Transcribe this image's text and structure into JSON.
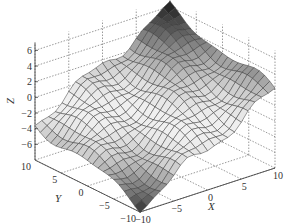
{
  "chart_data": {
    "type": "surface3d",
    "title": "",
    "xlabel": "X",
    "ylabel": "Y",
    "zlabel": "Z",
    "xlim": [
      -10,
      10
    ],
    "ylim": [
      -10,
      10
    ],
    "zlim": [
      -8,
      7
    ],
    "x_ticks": [
      -10,
      -5,
      0,
      5,
      10
    ],
    "y_ticks": [
      -10,
      -5,
      0,
      5,
      10
    ],
    "z_ticks": [
      -6,
      -4,
      -2,
      0,
      2,
      4,
      6
    ],
    "grid": true,
    "colormap": "gray",
    "grid_resolution": 21,
    "surface_model": {
      "description": "Tilted plane with wave ripples along the diagonal",
      "intercept": -0.7,
      "slope_x": 0.45,
      "slope_y": 0.2,
      "ripple_amplitude": 0.8,
      "ripple_frequency": 0.55
    },
    "corner_values": [
      {
        "x": -10,
        "y": -10,
        "z": -7.0
      },
      {
        "x": 10,
        "y": -10,
        "z": 2.5
      },
      {
        "x": -10,
        "y": 10,
        "z": -3.5
      },
      {
        "x": 10,
        "y": 10,
        "z": 5.3
      }
    ]
  }
}
